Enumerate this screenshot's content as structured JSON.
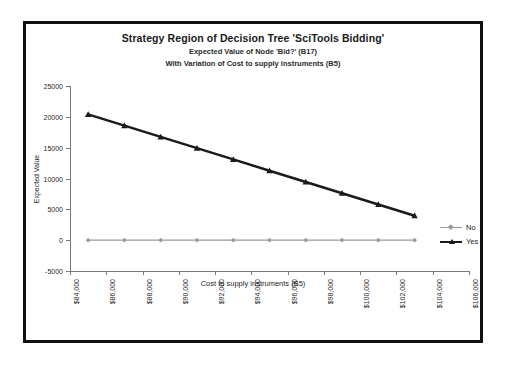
{
  "chart_data": {
    "type": "line",
    "title": "Strategy Region of Decision Tree 'SciTools Bidding'",
    "subtitle1": "Expected Value of Node 'Bid?' (B17)",
    "subtitle2": "With Variation of Cost to supply instruments (B5)",
    "xlabel": "Cost to supply instruments (B5)",
    "ylabel": "Expected Value",
    "xlim": [
      84000,
      106000
    ],
    "ylim": [
      -5000,
      25000
    ],
    "xticks": [
      "$84,000",
      "$86,000",
      "$88,000",
      "$90,000",
      "$92,000",
      "$94,000",
      "$96,000",
      "$98,000",
      "$100,000",
      "$102,000",
      "$104,000",
      "$106,000"
    ],
    "xtick_values": [
      84000,
      86000,
      88000,
      90000,
      92000,
      94000,
      96000,
      98000,
      100000,
      102000,
      104000,
      106000
    ],
    "yticks": [
      "25000",
      "20000",
      "15000",
      "10000",
      "5000",
      "0",
      "-5000"
    ],
    "ytick_values": [
      25000,
      20000,
      15000,
      10000,
      5000,
      0,
      -5000
    ],
    "grid": false,
    "legend_position": "right",
    "x": [
      85000,
      87000,
      89000,
      91000,
      93000,
      95000,
      97000,
      99000,
      101000,
      103000
    ],
    "series": [
      {
        "name": "No",
        "values": [
          0,
          0,
          0,
          0,
          0,
          0,
          0,
          0,
          0,
          0
        ],
        "color": "#9a9a9a",
        "marker": "diamond",
        "line_width": 1.2
      },
      {
        "name": "Yes",
        "values": [
          20400,
          18575,
          16750,
          14925,
          13100,
          11275,
          9450,
          7625,
          5800,
          3975
        ],
        "color": "#1a1a1a",
        "marker": "triangle",
        "line_width": 2.6
      }
    ]
  },
  "legend": {
    "items": [
      {
        "label": "No"
      },
      {
        "label": "Yes"
      }
    ]
  }
}
